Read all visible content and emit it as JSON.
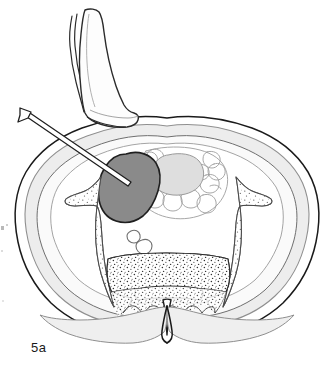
{
  "figure": {
    "caption_label": "5a",
    "background_color": "#ffffff",
    "line_color": "#1a1a1a",
    "thin_line_color": "#7a7a7a"
  },
  "colors": {
    "outline_dark": "#1a1a1a",
    "outline_mid": "#555555",
    "outline_light": "#8f8f8f",
    "mass_fill": "#8a8a8a",
    "mass_stroke": "#1f1f1f",
    "fat_band_fill": "#ededed",
    "muscle_fill": "#f7f7f7",
    "bowel_blob_fill": "#dedede",
    "bone_fill": "#fcfcfc",
    "stipple_color": "#2a2a2a",
    "probe_fill": "#fdfdfd",
    "needle_fill": "#ffffff",
    "vessel_fill": "#ffffff"
  },
  "structures": [
    {
      "id": "skin-outline",
      "label": "Skin / body surface outline",
      "interactable": false
    },
    {
      "id": "subcutaneous-fat-band",
      "label": "Subcutaneous fat layer",
      "fill": "#ededed",
      "interactable": false
    },
    {
      "id": "abdominal-wall-muscle",
      "label": "Abdominal wall musculature",
      "interactable": false
    },
    {
      "id": "renal-mass",
      "label": "Renal mass / target lesion",
      "fill": "#8a8a8a",
      "interactable": false
    },
    {
      "id": "bowel-loops",
      "label": "Bowel loops / mesentery",
      "interactable": false
    },
    {
      "id": "central-bowel-blob",
      "label": "Central bowel lumen",
      "fill": "#dedede",
      "interactable": false
    },
    {
      "id": "aorta-vessel",
      "label": "Aorta",
      "interactable": false
    },
    {
      "id": "ivc-vessel",
      "label": "Inferior vena cava",
      "interactable": false
    },
    {
      "id": "vertebral-body",
      "label": "Vertebral body with trabecular bone",
      "interactable": false
    },
    {
      "id": "spinal-canal",
      "label": "Spinal canal",
      "interactable": false
    },
    {
      "id": "spinous-process",
      "label": "Spinous process",
      "interactable": false
    },
    {
      "id": "transverse-process-left",
      "label": "Left transverse process",
      "interactable": false
    },
    {
      "id": "transverse-process-right",
      "label": "Right transverse process",
      "interactable": false
    },
    {
      "id": "paraspinal-muscles",
      "label": "Paraspinal muscles",
      "interactable": false
    }
  ],
  "instruments": [
    {
      "id": "ultrasound-transducer",
      "label": "Ultrasound transducer probe",
      "interactable": false
    },
    {
      "id": "biopsy-needle",
      "label": "Biopsy needle",
      "interactable": false
    },
    {
      "id": "needle-hub",
      "label": "Needle hub",
      "interactable": false
    }
  ]
}
